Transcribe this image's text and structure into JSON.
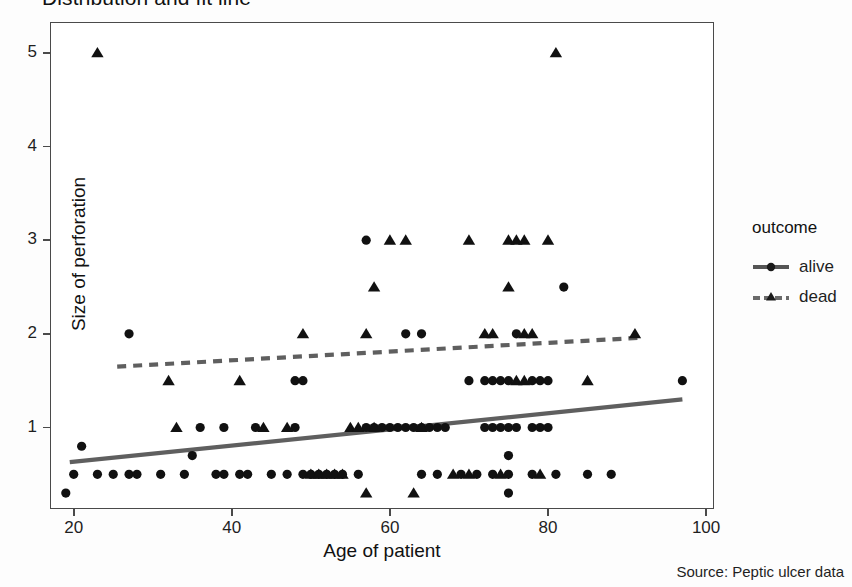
{
  "title": "Distribution and fit line",
  "caption": "Source: Peptic ulcer data",
  "legend": {
    "title": "outcome",
    "entries": [
      {
        "label": "alive",
        "marker": "circle",
        "line": "solid",
        "color": "#555555"
      },
      {
        "label": "dead",
        "marker": "triangle",
        "line": "dashed",
        "color": "#6a6a6a"
      }
    ]
  },
  "chart_data": {
    "type": "scatter",
    "title": "Distribution and fit line",
    "xlabel": "Age of patient",
    "ylabel": "Size of perforation",
    "xlim": [
      17,
      101
    ],
    "ylim": [
      0.13,
      5.33
    ],
    "xticks": [
      20,
      40,
      60,
      80,
      100
    ],
    "yticks": [
      1,
      2,
      3,
      4,
      5
    ],
    "grid": false,
    "legend_position": "right",
    "marker_color": "#111111",
    "fitline_color": "#5f5f5f",
    "series": [
      {
        "name": "alive",
        "marker": "circle",
        "points": [
          [
            19,
            0.3
          ],
          [
            21,
            0.8
          ],
          [
            20,
            0.5
          ],
          [
            23,
            0.5
          ],
          [
            25,
            0.5
          ],
          [
            27,
            2.0
          ],
          [
            27,
            0.5
          ],
          [
            28,
            0.5
          ],
          [
            31,
            0.5
          ],
          [
            34,
            0.5
          ],
          [
            35,
            0.7
          ],
          [
            36,
            1.0
          ],
          [
            38,
            0.5
          ],
          [
            39,
            1.0
          ],
          [
            39,
            0.5
          ],
          [
            41,
            0.5
          ],
          [
            42,
            0.5
          ],
          [
            43,
            1.0
          ],
          [
            45,
            0.5
          ],
          [
            47,
            0.5
          ],
          [
            48,
            1.5
          ],
          [
            49,
            1.5
          ],
          [
            48,
            1.0
          ],
          [
            49,
            0.5
          ],
          [
            50,
            0.5
          ],
          [
            51,
            0.5
          ],
          [
            52,
            0.5
          ],
          [
            53,
            0.5
          ],
          [
            54,
            0.5
          ],
          [
            56,
            0.5
          ],
          [
            57,
            3.0
          ],
          [
            57,
            1.0
          ],
          [
            58,
            1.0
          ],
          [
            59,
            1.0
          ],
          [
            60,
            1.0
          ],
          [
            61,
            1.0
          ],
          [
            62,
            2.0
          ],
          [
            62,
            1.0
          ],
          [
            64,
            2.0
          ],
          [
            63,
            1.0
          ],
          [
            64,
            1.0
          ],
          [
            65,
            1.0
          ],
          [
            66,
            1.0
          ],
          [
            67,
            1.0
          ],
          [
            64,
            0.5
          ],
          [
            66,
            0.5
          ],
          [
            69,
            0.5
          ],
          [
            71,
            0.5
          ],
          [
            70,
            1.5
          ],
          [
            72,
            1.5
          ],
          [
            73,
            1.5
          ],
          [
            74,
            1.5
          ],
          [
            75,
            1.5
          ],
          [
            72,
            1.0
          ],
          [
            73,
            1.0
          ],
          [
            74,
            1.0
          ],
          [
            75,
            1.0
          ],
          [
            76,
            1.0
          ],
          [
            75,
            0.7
          ],
          [
            75,
            0.3
          ],
          [
            76,
            2.0
          ],
          [
            78,
            1.5
          ],
          [
            79,
            1.5
          ],
          [
            80,
            1.5
          ],
          [
            78,
            1.0
          ],
          [
            79,
            1.0
          ],
          [
            80,
            1.0
          ],
          [
            82,
            2.5
          ],
          [
            73,
            0.5
          ],
          [
            75,
            0.5
          ],
          [
            78,
            0.5
          ],
          [
            81,
            0.5
          ],
          [
            85,
            0.5
          ],
          [
            88,
            0.5
          ],
          [
            97,
            1.5
          ]
        ]
      },
      {
        "name": "dead",
        "marker": "triangle",
        "points": [
          [
            23,
            5.0
          ],
          [
            32,
            1.5
          ],
          [
            33,
            1.0
          ],
          [
            41,
            1.5
          ],
          [
            44,
            1.0
          ],
          [
            47,
            1.0
          ],
          [
            49,
            2.0
          ],
          [
            50,
            0.5
          ],
          [
            51,
            0.5
          ],
          [
            52,
            0.5
          ],
          [
            53,
            0.5
          ],
          [
            54,
            0.5
          ],
          [
            55,
            1.0
          ],
          [
            56,
            1.0
          ],
          [
            57,
            2.0
          ],
          [
            57,
            0.3
          ],
          [
            58,
            1.0
          ],
          [
            60,
            3.0
          ],
          [
            62,
            3.0
          ],
          [
            58,
            2.5
          ],
          [
            63,
            0.3
          ],
          [
            64,
            1.0
          ],
          [
            68,
            0.5
          ],
          [
            70,
            3.0
          ],
          [
            70,
            0.5
          ],
          [
            72,
            2.0
          ],
          [
            73,
            2.0
          ],
          [
            75,
            3.0
          ],
          [
            76,
            3.0
          ],
          [
            77,
            3.0
          ],
          [
            75,
            2.5
          ],
          [
            77,
            2.0
          ],
          [
            78,
            2.0
          ],
          [
            80,
            3.0
          ],
          [
            81,
            5.0
          ],
          [
            76,
            1.5
          ],
          [
            77,
            1.5
          ],
          [
            85,
            1.5
          ],
          [
            91,
            2.0
          ],
          [
            74,
            0.5
          ],
          [
            79,
            0.5
          ]
        ]
      }
    ],
    "fit_lines": [
      {
        "name": "alive",
        "style": "solid",
        "x0": 19.5,
        "y0": 0.63,
        "x1": 97.0,
        "y1": 1.3
      },
      {
        "name": "dead",
        "style": "dashed",
        "x0": 25.5,
        "y0": 1.65,
        "x1": 92.0,
        "y1": 1.96
      }
    ]
  }
}
